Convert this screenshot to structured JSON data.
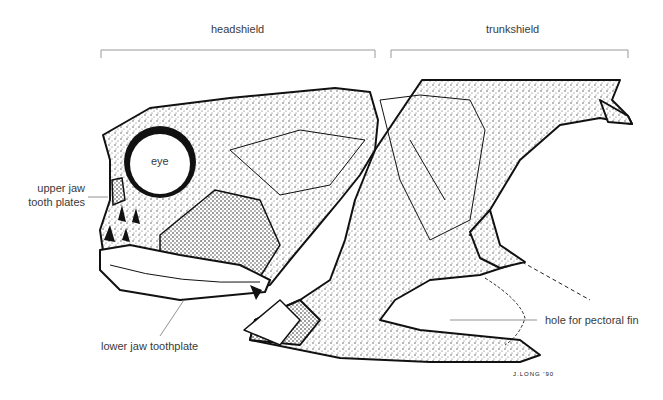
{
  "diagram": {
    "region_labels": {
      "headshield": "headshield",
      "trunkshield": "trunkshield"
    },
    "labels": {
      "eye": "eye",
      "upper_jaw_line1": "upper jaw",
      "upper_jaw_line2": "tooth plates",
      "lower_jaw": "lower jaw toothplate",
      "pectoral": "hole for pectoral fin"
    },
    "signature": "J.LONG '90",
    "colors": {
      "ink": "#111111",
      "stipple": "#555555",
      "bracket": "#999999",
      "leader": "#777777"
    }
  }
}
